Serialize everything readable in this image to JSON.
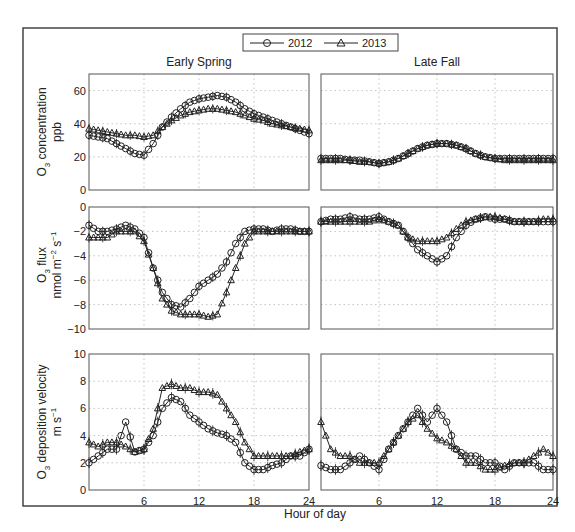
{
  "chart_data": {
    "type": "line",
    "title": "",
    "legend": {
      "position": "top-center",
      "entries": [
        {
          "name": "2012",
          "marker": "circle"
        },
        {
          "name": "2013",
          "marker": "triangle"
        }
      ]
    },
    "columns": [
      "Early Spring",
      "Late Fall"
    ],
    "xlabel": "Hour of day",
    "xlim": [
      0,
      24
    ],
    "xticks": [
      6,
      12,
      18,
      24
    ],
    "grid": true,
    "x": [
      0,
      1,
      2,
      3,
      4,
      5,
      6,
      7,
      8,
      9,
      10,
      11,
      12,
      13,
      14,
      15,
      16,
      17,
      18,
      19,
      20,
      21,
      22,
      23,
      24
    ],
    "rows": [
      {
        "ylabel_line1": "O3 concentration",
        "ylabel_line2": "ppb",
        "ylim": [
          0,
          70
        ],
        "yticks": [
          0,
          20,
          40,
          60
        ],
        "panels": [
          {
            "column": "Early Spring",
            "series": [
              {
                "name": "2012",
                "values": [
                  33,
                  32,
                  31,
                  28,
                  25,
                  22,
                  21,
                  28,
                  38,
                  44,
                  49,
                  53,
                  55,
                  56,
                  57,
                  56,
                  53,
                  49,
                  46,
                  44,
                  42,
                  40,
                  38,
                  36,
                  34
                ]
              },
              {
                "name": "2013",
                "values": [
                  37,
                  36,
                  35,
                  34,
                  33,
                  33,
                  32,
                  33,
                  38,
                  42,
                  45,
                  47,
                  48,
                  49,
                  49,
                  48,
                  47,
                  45,
                  43,
                  42,
                  40,
                  39,
                  38,
                  37,
                  36
                ]
              }
            ]
          },
          {
            "column": "Late Fall",
            "series": [
              {
                "name": "2012",
                "values": [
                  19,
                  19,
                  19,
                  18,
                  18,
                  17,
                  16,
                  17,
                  19,
                  22,
                  25,
                  27,
                  28,
                  28,
                  27,
                  25,
                  22,
                  20,
                  19,
                  19,
                  19,
                  19,
                  19,
                  19,
                  19
                ]
              },
              {
                "name": "2013",
                "values": [
                  18,
                  18,
                  18,
                  18,
                  17,
                  17,
                  16,
                  17,
                  19,
                  22,
                  25,
                  27,
                  28,
                  28,
                  27,
                  25,
                  22,
                  20,
                  19,
                  18,
                  18,
                  18,
                  18,
                  18,
                  18
                ]
              }
            ]
          }
        ]
      },
      {
        "ylabel_line1": "O3 flux",
        "ylabel_line2": "nmol m-2 s-1",
        "ylim": [
          -10,
          0
        ],
        "yticks": [
          -10,
          -8,
          -6,
          -4,
          -2,
          0
        ],
        "panels": [
          {
            "column": "Early Spring",
            "series": [
              {
                "name": "2012",
                "values": [
                  -1.5,
                  -2,
                  -2,
                  -1.8,
                  -1.5,
                  -1.8,
                  -2.5,
                  -5,
                  -7,
                  -8,
                  -8.2,
                  -7.5,
                  -6.5,
                  -6,
                  -5.5,
                  -4.5,
                  -3,
                  -2,
                  -1.8,
                  -1.8,
                  -2,
                  -1.8,
                  -1.8,
                  -2,
                  -2
                ]
              },
              {
                "name": "2013",
                "values": [
                  -2.5,
                  -2.5,
                  -2.5,
                  -2,
                  -2,
                  -2,
                  -2.8,
                  -5,
                  -7.5,
                  -8.5,
                  -8.8,
                  -8.8,
                  -8.8,
                  -9,
                  -8.8,
                  -7,
                  -5,
                  -3,
                  -2,
                  -2,
                  -2,
                  -2,
                  -2,
                  -2,
                  -2
                ]
              }
            ]
          },
          {
            "column": "Late Fall",
            "series": [
              {
                "name": "2012",
                "values": [
                  -1.2,
                  -1,
                  -1,
                  -0.8,
                  -1,
                  -1,
                  -0.8,
                  -1.2,
                  -1.5,
                  -2.5,
                  -3.5,
                  -4,
                  -4.5,
                  -4,
                  -2.5,
                  -1.5,
                  -1,
                  -0.8,
                  -1,
                  -1,
                  -1.2,
                  -1.2,
                  -1.2,
                  -1.2,
                  -1.2
                ]
              },
              {
                "name": "2013",
                "values": [
                  -1.2,
                  -1.2,
                  -1.2,
                  -1.2,
                  -1.2,
                  -1.2,
                  -1,
                  -1.2,
                  -1.5,
                  -2.5,
                  -2.8,
                  -2.8,
                  -2.8,
                  -2.5,
                  -1.8,
                  -1.2,
                  -1,
                  -0.8,
                  -0.8,
                  -1,
                  -1.2,
                  -1.2,
                  -1.2,
                  -1,
                  -1
                ]
              }
            ]
          }
        ]
      },
      {
        "ylabel_line1": "O3 deposition velocity",
        "ylabel_line2": "m s-1",
        "ylim": [
          0,
          10
        ],
        "yticks": [
          0,
          2,
          4,
          6,
          8,
          10
        ],
        "panels": [
          {
            "column": "Early Spring",
            "series": [
              {
                "name": "2012",
                "values": [
                  2,
                  2.5,
                  3,
                  3,
                  5,
                  2.8,
                  3,
                  4,
                  6,
                  6.8,
                  6.5,
                  5.5,
                  5,
                  4.5,
                  4.2,
                  4,
                  3.5,
                  2,
                  1.5,
                  1.5,
                  1.8,
                  2,
                  2.5,
                  2.5,
                  3
                ]
              },
              {
                "name": "2013",
                "values": [
                  3.5,
                  3.2,
                  3.5,
                  3.5,
                  3.2,
                  2.8,
                  3,
                  4.5,
                  7.5,
                  7.8,
                  7.5,
                  7.5,
                  7.2,
                  7.2,
                  7,
                  6,
                  5,
                  3.5,
                  2.5,
                  2.5,
                  2.5,
                  2.5,
                  2.5,
                  2.8,
                  3
                ]
              }
            ]
          },
          {
            "column": "Late Fall",
            "series": [
              {
                "name": "2012",
                "values": [
                  1.8,
                  1.5,
                  1.5,
                  2,
                  2.5,
                  2,
                  1.5,
                  3,
                  4,
                  5,
                  6,
                  5,
                  6,
                  5,
                  3,
                  2.5,
                  2.5,
                  2,
                  2,
                  1.5,
                  2,
                  2,
                  2,
                  1.5,
                  1.5
                ]
              },
              {
                "name": "2013",
                "values": [
                  5,
                  3,
                  2.5,
                  2.5,
                  2,
                  2,
                  2,
                  3,
                  4,
                  5,
                  5.5,
                  4.5,
                  3.8,
                  3.5,
                  3,
                  2,
                  2,
                  1.5,
                  1.5,
                  1.8,
                  2,
                  2,
                  2.5,
                  3,
                  2.5
                ]
              }
            ]
          }
        ]
      }
    ]
  },
  "labels": {
    "legend_2012": "2012",
    "legend_2013": "2013",
    "col_left": "Early Spring",
    "col_right": "Late Fall",
    "xlabel": "Hour of day",
    "row1_y1": "O",
    "row1_y1_sub": "3",
    "row1_y1_rest": " concentration",
    "row1_y2": "ppb",
    "row2_y1": "O",
    "row2_y1_sub": "3",
    "row2_y1_rest": " flux",
    "row2_y2": "nmol m",
    "row2_y2_sup1": "−2",
    "row2_y2_mid": " s",
    "row2_y2_sup2": "−1",
    "row3_y1": "O",
    "row3_y1_sub": "3",
    "row3_y1_rest": " deposition velocity",
    "row3_y2": "m s",
    "row3_y2_sup": "−1"
  }
}
